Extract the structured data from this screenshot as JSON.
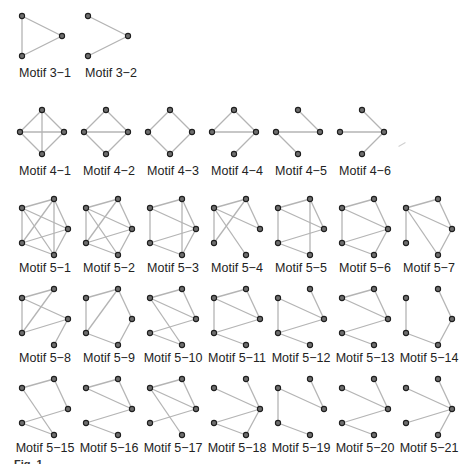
{
  "figure": {
    "caption_visible": "Fig. 1  ...",
    "colors": {
      "edge": "#b4b4b4",
      "node_fill": "#6e6e6e",
      "node_stroke": "#1e1e1e",
      "text": "#222222"
    }
  },
  "layouts": {
    "tri": [
      [
        10,
        16
      ],
      [
        50,
        36
      ],
      [
        10,
        56
      ]
    ],
    "diamond": [
      [
        30,
        8
      ],
      [
        8,
        30
      ],
      [
        52,
        30
      ],
      [
        30,
        52
      ]
    ],
    "pent": [
      [
        10,
        15
      ],
      [
        42,
        6
      ],
      [
        56,
        36
      ],
      [
        42,
        62
      ],
      [
        10,
        50
      ]
    ]
  },
  "motifs": [
    {
      "label": "Motif 3−1",
      "x": 12,
      "y": 0,
      "layout": "tri",
      "edges": [
        [
          0,
          1
        ],
        [
          1,
          2
        ],
        [
          0,
          2
        ]
      ]
    },
    {
      "label": "Motif 3−2",
      "x": 78,
      "y": 0,
      "layout": "tri",
      "edges": [
        [
          0,
          1
        ],
        [
          1,
          2
        ]
      ]
    },
    {
      "label": "Motif 4−1",
      "x": 12,
      "y": 102,
      "layout": "diamond",
      "edges": [
        [
          0,
          1
        ],
        [
          0,
          2
        ],
        [
          1,
          3
        ],
        [
          2,
          3
        ],
        [
          1,
          2
        ],
        [
          0,
          3
        ]
      ]
    },
    {
      "label": "Motif 4−2",
      "x": 76,
      "y": 102,
      "layout": "diamond",
      "edges": [
        [
          0,
          1
        ],
        [
          0,
          2
        ],
        [
          1,
          3
        ],
        [
          2,
          3
        ],
        [
          1,
          2
        ]
      ]
    },
    {
      "label": "Motif 4−3",
      "x": 140,
      "y": 102,
      "layout": "diamond",
      "edges": [
        [
          0,
          1
        ],
        [
          0,
          2
        ],
        [
          1,
          3
        ],
        [
          2,
          3
        ]
      ]
    },
    {
      "label": "Motif 4−4",
      "x": 204,
      "y": 102,
      "layout": "diamond",
      "edges": [
        [
          0,
          1
        ],
        [
          0,
          2
        ],
        [
          1,
          2
        ],
        [
          2,
          3
        ]
      ]
    },
    {
      "label": "Motif 4−5",
      "x": 268,
      "y": 102,
      "layout": "diamond",
      "edges": [
        [
          0,
          2
        ],
        [
          1,
          2
        ],
        [
          1,
          3
        ]
      ]
    },
    {
      "label": "Motif 4−6",
      "x": 332,
      "y": 102,
      "layout": "diamond",
      "edges": [
        [
          0,
          2
        ],
        [
          1,
          2
        ],
        [
          2,
          3
        ]
      ]
    },
    {
      "label": "Motif 5−1",
      "x": 12,
      "y": 193,
      "layout": "pent",
      "edges": [
        [
          0,
          1
        ],
        [
          1,
          2
        ],
        [
          2,
          3
        ],
        [
          3,
          4
        ],
        [
          4,
          0
        ],
        [
          0,
          2
        ],
        [
          0,
          3
        ],
        [
          1,
          3
        ],
        [
          1,
          4
        ],
        [
          2,
          4
        ]
      ]
    },
    {
      "label": "Motif 5−2",
      "x": 76,
      "y": 193,
      "layout": "pent",
      "edges": [
        [
          0,
          1
        ],
        [
          1,
          2
        ],
        [
          2,
          3
        ],
        [
          3,
          4
        ],
        [
          4,
          0
        ],
        [
          0,
          2
        ],
        [
          0,
          3
        ],
        [
          1,
          4
        ],
        [
          2,
          4
        ]
      ]
    },
    {
      "label": "Motif 5−3",
      "x": 140,
      "y": 193,
      "layout": "pent",
      "edges": [
        [
          0,
          1
        ],
        [
          1,
          2
        ],
        [
          2,
          3
        ],
        [
          3,
          4
        ],
        [
          4,
          0
        ],
        [
          0,
          2
        ],
        [
          1,
          3
        ],
        [
          2,
          4
        ]
      ]
    },
    {
      "label": "Motif 5−4",
      "x": 204,
      "y": 193,
      "layout": "pent",
      "edges": [
        [
          0,
          1
        ],
        [
          1,
          2
        ],
        [
          4,
          0
        ],
        [
          0,
          2
        ],
        [
          0,
          3
        ],
        [
          1,
          4
        ]
      ]
    },
    {
      "label": "Motif 5−5",
      "x": 268,
      "y": 193,
      "layout": "pent",
      "edges": [
        [
          0,
          1
        ],
        [
          1,
          2
        ],
        [
          4,
          0
        ],
        [
          0,
          2
        ],
        [
          1,
          3
        ],
        [
          2,
          4
        ],
        [
          3,
          4
        ]
      ]
    },
    {
      "label": "Motif 5−6",
      "x": 332,
      "y": 193,
      "layout": "pent",
      "edges": [
        [
          0,
          1
        ],
        [
          1,
          2
        ],
        [
          2,
          3
        ],
        [
          3,
          4
        ],
        [
          4,
          0
        ],
        [
          0,
          2
        ],
        [
          2,
          4
        ]
      ]
    },
    {
      "label": "Motif 5−7",
      "x": 396,
      "y": 193,
      "layout": "pent",
      "edges": [
        [
          0,
          1
        ],
        [
          1,
          2
        ],
        [
          2,
          3
        ],
        [
          4,
          0
        ],
        [
          0,
          2
        ],
        [
          0,
          3
        ]
      ]
    },
    {
      "label": "Motif 5−8",
      "x": 12,
      "y": 283,
      "layout": "pent",
      "edges": [
        [
          0,
          1
        ],
        [
          4,
          0
        ],
        [
          0,
          2
        ],
        [
          1,
          4
        ],
        [
          2,
          4
        ],
        [
          2,
          3
        ]
      ]
    },
    {
      "label": "Motif 5−9",
      "x": 76,
      "y": 283,
      "layout": "pent",
      "edges": [
        [
          0,
          1
        ],
        [
          1,
          2
        ],
        [
          2,
          3
        ],
        [
          3,
          4
        ],
        [
          4,
          0
        ],
        [
          1,
          4
        ]
      ]
    },
    {
      "label": "Motif 5−10",
      "x": 140,
      "y": 283,
      "layout": "pent",
      "edges": [
        [
          0,
          1
        ],
        [
          1,
          2
        ],
        [
          0,
          2
        ],
        [
          0,
          3
        ],
        [
          2,
          4
        ],
        [
          3,
          4
        ]
      ]
    },
    {
      "label": "Motif 5−11",
      "x": 204,
      "y": 283,
      "layout": "pent",
      "edges": [
        [
          0,
          1
        ],
        [
          1,
          2
        ],
        [
          0,
          2
        ],
        [
          4,
          0
        ],
        [
          2,
          4
        ],
        [
          3,
          4
        ]
      ]
    },
    {
      "label": "Motif 5−12",
      "x": 268,
      "y": 283,
      "layout": "pent",
      "edges": [
        [
          4,
          0
        ],
        [
          0,
          2
        ],
        [
          1,
          2
        ],
        [
          2,
          4
        ],
        [
          3,
          4
        ]
      ]
    },
    {
      "label": "Motif 5−13",
      "x": 332,
      "y": 283,
      "layout": "pent",
      "edges": [
        [
          0,
          1
        ],
        [
          0,
          2
        ],
        [
          1,
          2
        ],
        [
          2,
          4
        ],
        [
          3,
          4
        ]
      ]
    },
    {
      "label": "Motif 5−14",
      "x": 396,
      "y": 283,
      "layout": "pent",
      "edges": [
        [
          4,
          0
        ],
        [
          3,
          4
        ],
        [
          2,
          3
        ],
        [
          1,
          2
        ]
      ]
    },
    {
      "label": "Motif 5−15",
      "x": 12,
      "y": 373,
      "layout": "pent",
      "edges": [
        [
          0,
          1
        ],
        [
          1,
          2
        ],
        [
          0,
          3
        ],
        [
          3,
          4
        ],
        [
          2,
          4
        ]
      ]
    },
    {
      "label": "Motif 5−16",
      "x": 76,
      "y": 373,
      "layout": "pent",
      "edges": [
        [
          0,
          1
        ],
        [
          0,
          2
        ],
        [
          1,
          2
        ],
        [
          2,
          4
        ],
        [
          3,
          4
        ]
      ]
    },
    {
      "label": "Motif 5−17",
      "x": 140,
      "y": 373,
      "layout": "pent",
      "edges": [
        [
          0,
          1
        ],
        [
          1,
          2
        ],
        [
          0,
          2
        ],
        [
          0,
          3
        ],
        [
          2,
          4
        ]
      ]
    },
    {
      "label": "Motif 5−18",
      "x": 204,
      "y": 373,
      "layout": "pent",
      "edges": [
        [
          0,
          2
        ],
        [
          1,
          2
        ],
        [
          2,
          4
        ],
        [
          2,
          3
        ],
        [
          3,
          4
        ]
      ]
    },
    {
      "label": "Motif 5−19",
      "x": 268,
      "y": 373,
      "layout": "pent",
      "edges": [
        [
          0,
          2
        ],
        [
          1,
          2
        ],
        [
          4,
          0
        ],
        [
          3,
          4
        ]
      ]
    },
    {
      "label": "Motif 5−20",
      "x": 332,
      "y": 373,
      "layout": "pent",
      "edges": [
        [
          0,
          2
        ],
        [
          1,
          2
        ],
        [
          2,
          4
        ],
        [
          3,
          4
        ]
      ]
    },
    {
      "label": "Motif 5−21",
      "x": 396,
      "y": 373,
      "layout": "pent",
      "edges": [
        [
          0,
          2
        ],
        [
          1,
          2
        ],
        [
          2,
          4
        ],
        [
          2,
          3
        ]
      ]
    }
  ]
}
